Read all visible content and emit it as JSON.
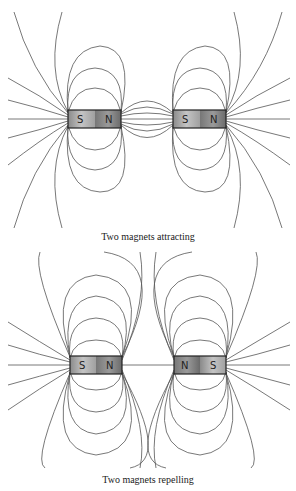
{
  "diagrams": [
    {
      "id": "attracting",
      "caption": "Two magnets attracting",
      "magnets": [
        {
          "left_pole": "S",
          "right_pole": "N"
        },
        {
          "left_pole": "S",
          "right_pole": "N"
        }
      ]
    },
    {
      "id": "repelling",
      "caption": "Two magnets repelling",
      "magnets": [
        {
          "left_pole": "S",
          "right_pole": "N"
        },
        {
          "left_pole": "N",
          "right_pole": "S"
        }
      ]
    }
  ],
  "colors": {
    "line": "#555555",
    "magnet_light": "#b0b0b0",
    "magnet_dark": "#777777",
    "border": "#222222"
  }
}
